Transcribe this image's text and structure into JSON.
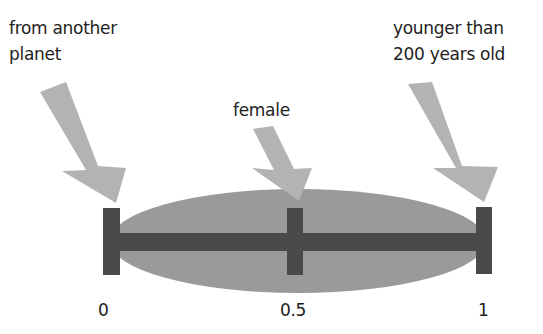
{
  "labels": {
    "left_line1": "from another",
    "left_line2": "planet",
    "middle": "female",
    "right_line1": "younger than",
    "right_line2": "200 years old"
  },
  "axis": {
    "tick_0": "0",
    "tick_mid": "0.5",
    "tick_1": "1"
  },
  "colors": {
    "arrow": "#b3b3b3",
    "ellipse": "#9a9a9a",
    "bar": "#4a4a4a",
    "text": "#222222"
  }
}
